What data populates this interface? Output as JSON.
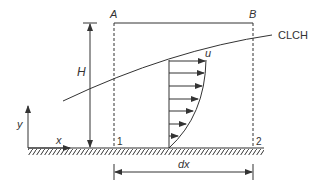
{
  "diagram": {
    "type": "boundary-layer control volume",
    "labels": {
      "point_a": "A",
      "point_b": "B",
      "curve": "CLCH",
      "velocity": "u",
      "height": "H",
      "y_axis": "y",
      "x_axis": "x",
      "section_1": "1",
      "section_2": "2",
      "width": "dx"
    },
    "colors": {
      "stroke": "#333333",
      "background": "#ffffff"
    },
    "velocity_profile_arrows": 7
  }
}
